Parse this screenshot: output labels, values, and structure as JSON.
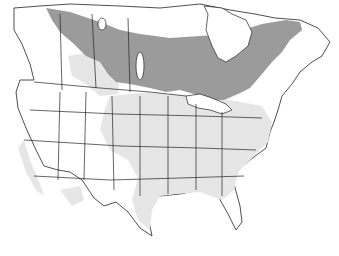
{
  "map": {
    "title": "",
    "region": "North America (Canada, United States, northern Mexico)",
    "legend": [],
    "colors": {
      "background": "#ffffff",
      "land": "#ffffff",
      "borders": "#222222",
      "breeding_range": "#9b9b9b",
      "wintering_range": "#e6e6e6"
    },
    "ranges": [
      {
        "name": "breeding-range",
        "description": "Dark gray band across boreal Canada from Yukon/NWT east through Manitoba, Ontario, Quebec to Labrador and Maritimes"
      },
      {
        "name": "wintering-range",
        "description": "Light gray across most of the eastern and central United States, Pacific coast, and Texas"
      }
    ]
  }
}
